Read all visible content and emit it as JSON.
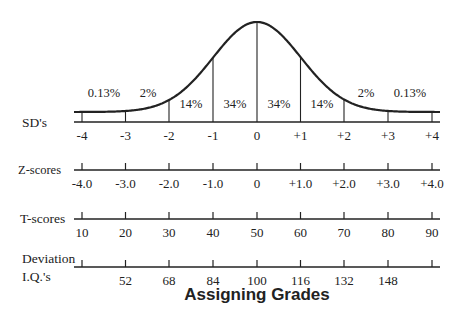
{
  "title": "Assigning Grades",
  "colors": {
    "ink": "#222222",
    "background": "#ffffff"
  },
  "curve": {
    "percent_labels": [
      {
        "text": "0.13%",
        "x": 104,
        "y": 97
      },
      {
        "text": "2%",
        "x": 148,
        "y": 97
      },
      {
        "text": "14%",
        "x": 191,
        "y": 108
      },
      {
        "text": "34%",
        "x": 235,
        "y": 108
      },
      {
        "text": "34%",
        "x": 279,
        "y": 108
      },
      {
        "text": "14%",
        "x": 322,
        "y": 108
      },
      {
        "text": "2%",
        "x": 366,
        "y": 97
      },
      {
        "text": "0.13%",
        "x": 410,
        "y": 97
      }
    ]
  },
  "scales": [
    {
      "name": "SD's",
      "label_lines": [
        "SD's"
      ],
      "ticks": [
        "-4",
        "-3",
        "-2",
        "-1",
        "0",
        "+1",
        "+2",
        "+3",
        "+4"
      ]
    },
    {
      "name": "Z-scores",
      "label_lines": [
        "Z-scores"
      ],
      "ticks": [
        "-4.0",
        "-3.0",
        "-2.0",
        "-1.0",
        "0",
        "+1.0",
        "+2.0",
        "+3.0",
        "+4.0"
      ]
    },
    {
      "name": "T-scores",
      "label_lines": [
        "T-scores"
      ],
      "ticks": [
        "10",
        "20",
        "30",
        "40",
        "50",
        "60",
        "70",
        "80",
        "90"
      ]
    },
    {
      "name": "Deviation I.Q.'s",
      "label_lines": [
        "Deviation",
        "I.Q.'s"
      ],
      "ticks": [
        "",
        "52",
        "68",
        "84",
        "100",
        "116",
        "132",
        "148",
        ""
      ]
    }
  ],
  "chart_data": {
    "type": "area",
    "title": "Assigning Grades",
    "x": [
      -4,
      -3,
      -2,
      -1,
      0,
      1,
      2,
      3,
      4
    ],
    "band_percentages": [
      "0.13%",
      "2%",
      "14%",
      "34%",
      "34%",
      "14%",
      "2%",
      "0.13%"
    ],
    "scales": {
      "SD's": [
        "-4",
        "-3",
        "-2",
        "-1",
        "0",
        "+1",
        "+2",
        "+3",
        "+4"
      ],
      "Z-scores": [
        "-4.0",
        "-3.0",
        "-2.0",
        "-1.0",
        "0",
        "+1.0",
        "+2.0",
        "+3.0",
        "+4.0"
      ],
      "T-scores": [
        10,
        20,
        30,
        40,
        50,
        60,
        70,
        80,
        90
      ],
      "Deviation I.Q.'s": [
        null,
        52,
        68,
        84,
        100,
        116,
        132,
        148,
        null
      ]
    },
    "xlabel": "",
    "ylabel": "",
    "grid": false
  }
}
